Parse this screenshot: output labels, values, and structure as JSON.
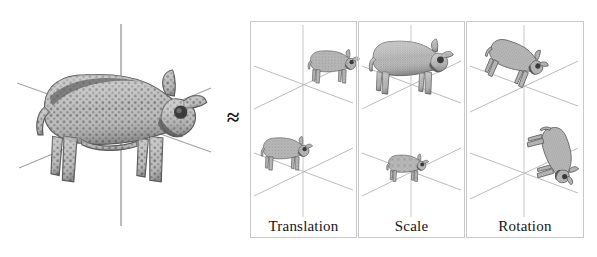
{
  "figure": {
    "kind": "transformation-decomposition-diagram",
    "relation_symbol": "≈",
    "background_color": "#ffffff",
    "axis_line_color": "#a9a9a9",
    "panel_border_color": "#c8c8c8",
    "mesh_fill_color": "#9a9a9a",
    "mesh_stroke_color": "#4a4a4a"
  },
  "source": {
    "name": "original-cow-model",
    "axes": {
      "vertical_label": "",
      "diagonal_left_label": "",
      "diagonal_right_label": ""
    }
  },
  "panels": [
    {
      "id": "translation",
      "label": "Translation",
      "instances": [
        {
          "position": "upper-right",
          "scale": 1.0,
          "rotation_deg": 0
        },
        {
          "position": "lower-left",
          "scale": 1.0,
          "rotation_deg": 0
        }
      ]
    },
    {
      "id": "scale",
      "label": "Scale",
      "instances": [
        {
          "position": "upper-center",
          "scale": 1.6,
          "rotation_deg": 0
        },
        {
          "position": "lower-center",
          "scale": 0.8,
          "rotation_deg": 0
        }
      ]
    },
    {
      "id": "rotation",
      "label": "Rotation",
      "instances": [
        {
          "position": "upper-center",
          "scale": 1.2,
          "rotation_deg": 22
        },
        {
          "position": "lower-center",
          "scale": 1.2,
          "rotation_deg": 78
        }
      ]
    }
  ]
}
